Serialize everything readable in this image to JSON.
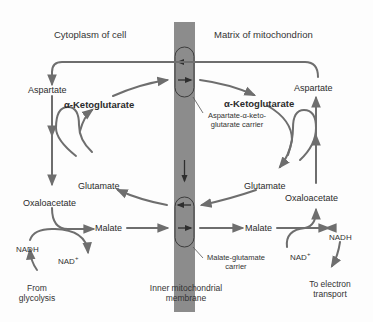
{
  "diagram": {
    "regions": {
      "cytoplasm": "Cytoplasm of cell",
      "matrix": "Matrix of mitochondrion",
      "membrane_line1": "Inner mitochondrial",
      "membrane_line2": "membrane"
    },
    "cytoplasm_side": {
      "aspartate": "Aspartate",
      "alpha_ketoglutarate": "α-Ketoglutarate",
      "glutamate": "Glutamate",
      "oxaloacetate": "Oxaloacetate",
      "malate": "Malate",
      "nadh": "NADH",
      "nad_plus": "NAD",
      "nad_plus_sup": "+",
      "source_line1": "From",
      "source_line2": "glycolysis"
    },
    "matrix_side": {
      "aspartate": "Aspartate",
      "alpha_ketoglutarate": "α-Ketoglutarate",
      "glutamate": "Glutamate",
      "oxaloacetate": "Oxaloacetate",
      "malate": "Malate",
      "nadh": "NADH",
      "nad_plus": "NAD",
      "nad_plus_sup": "+",
      "dest_line1": "To electron",
      "dest_line2": "transport"
    },
    "carriers": [
      {
        "name_line1": "Aspartate-α-keto-",
        "name_line2": "glutarate carrier"
      },
      {
        "name_line1": "Malate-glutamate",
        "name_line2": "carrier"
      }
    ],
    "colors": {
      "membrane": "#8a8a8a",
      "arrow": "#6e6e6e",
      "carrier_outline": "#3c3c3c",
      "carrier_arrow": "#2e2e2e"
    }
  }
}
